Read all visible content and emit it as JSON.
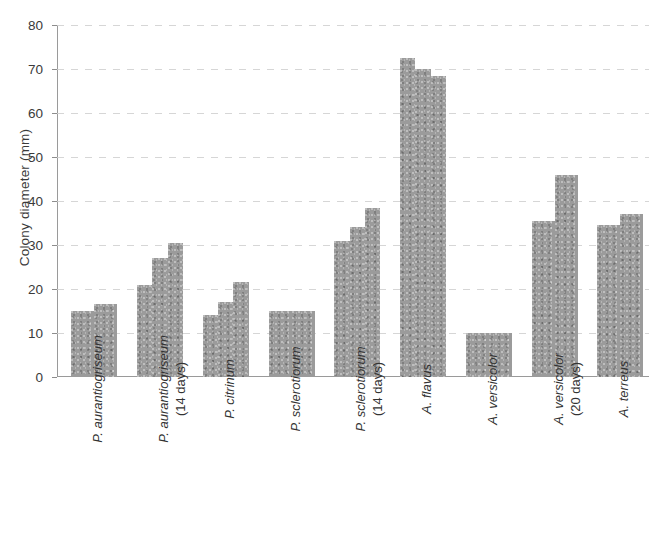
{
  "chart_data": {
    "type": "bar",
    "title": "",
    "xlabel": "",
    "ylabel": "Colony diameter (mm)",
    "ylim": [
      0,
      80
    ],
    "ytick_values": [
      0,
      10,
      20,
      30,
      40,
      50,
      60,
      70,
      80
    ],
    "ytick_labels": [
      "0",
      "10",
      "20",
      "30",
      "40",
      "50",
      "60",
      "70",
      "80"
    ],
    "grid": true,
    "legend": "none",
    "bar_color": "#9b9b9b",
    "categories": [
      "P. aurantiogriseum",
      "P. aurantiogriseum (14 days)",
      "P. citrinum",
      "P. sclerotiorum",
      "P. sclerotiorum (14 days)",
      "A. flavus",
      "A. versicolor",
      "A. versicolor (20 days)",
      "A. terreus"
    ],
    "groups": [
      {
        "label": "P. aurantiogriseum",
        "label_line1": "P. aurantiogriseum",
        "label_line2": "",
        "values": [
          15,
          16.5
        ]
      },
      {
        "label": "P. aurantiogriseum (14 days)",
        "label_line1": "P. aurantiogriseum",
        "label_line2": "(14 days)",
        "values": [
          21,
          27,
          30.5
        ]
      },
      {
        "label": "P. citrinum",
        "label_line1": "P. citrinum",
        "label_line2": "",
        "values": [
          14,
          17,
          21.5
        ]
      },
      {
        "label": "P. sclerotiorum",
        "label_line1": "P. sclerotiorum",
        "label_line2": "",
        "values": [
          15,
          15
        ]
      },
      {
        "label": "P. sclerotiorum (14 days)",
        "label_line1": "P. sclerotiorum",
        "label_line2": "(14 days)",
        "values": [
          31,
          34,
          38.5
        ]
      },
      {
        "label": "A. flavus",
        "label_line1": "A. flavus",
        "label_line2": "",
        "values": [
          72.5,
          70,
          68.5
        ]
      },
      {
        "label": "A. versicolor",
        "label_line1": "A. versicolor",
        "label_line2": "",
        "values": [
          10,
          10
        ]
      },
      {
        "label": "A. versicolor (20 days)",
        "label_line1": "A. versicolor",
        "label_line2": "(20 days)",
        "values": [
          35.5,
          46
        ]
      },
      {
        "label": "A. terreus",
        "label_line1": "A. terreus",
        "label_line2": "",
        "values": [
          34.5,
          37
        ]
      }
    ]
  }
}
